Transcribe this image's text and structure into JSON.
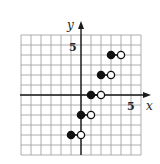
{
  "chart_data": {
    "type": "scatter",
    "subtype": "step-function",
    "title": "",
    "xlabel": "x",
    "ylabel": "y",
    "xlim": [
      -6,
      6
    ],
    "ylim": [
      -6,
      6
    ],
    "grid": true,
    "grid_step": 1,
    "tick_labels": {
      "x": [
        {
          "value": 5,
          "label": "5"
        }
      ],
      "y": [
        {
          "value": 5,
          "label": "5"
        }
      ]
    },
    "segments": [
      {
        "y": -4,
        "x_start": -1,
        "x_end": 0,
        "start_closed": true,
        "end_closed": false
      },
      {
        "y": -2,
        "x_start": 0,
        "x_end": 1,
        "start_closed": true,
        "end_closed": false
      },
      {
        "y": 0,
        "x_start": 1,
        "x_end": 2,
        "start_closed": true,
        "end_closed": false
      },
      {
        "y": 2,
        "x_start": 2,
        "x_end": 3,
        "start_closed": true,
        "end_closed": false
      },
      {
        "y": 4,
        "x_start": 3,
        "x_end": 4,
        "start_closed": true,
        "end_closed": false
      }
    ]
  },
  "axes": {
    "x_label": "x",
    "y_label": "y",
    "x_tick_label": "5",
    "y_tick_label": "5"
  },
  "colors": {
    "grid": "#9a9a9a",
    "axis": "#1a1a1a",
    "point": "#111111",
    "background": "#ffffff"
  },
  "layout": {
    "origin_px": [
      81,
      95
    ],
    "unit_px": 10
  }
}
